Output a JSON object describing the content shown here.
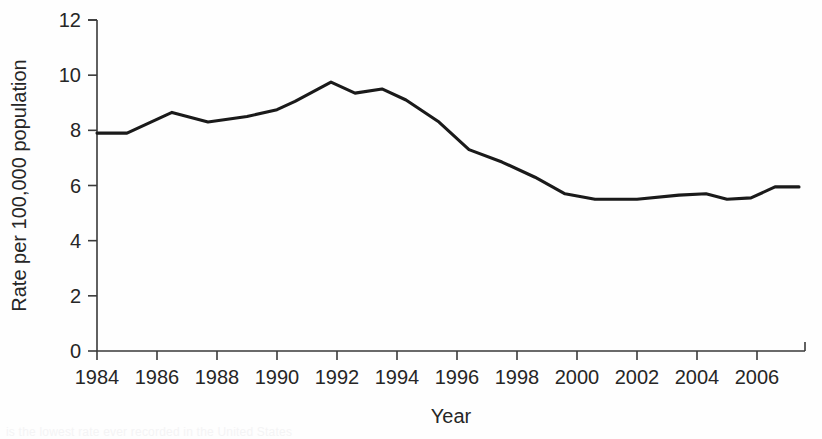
{
  "figure": {
    "background_color": "#fefefe",
    "line_color": "#1a1a1a",
    "axis_color": "#3a3a3a",
    "caption_partial": "is the lowest rate ever recorded in the United States"
  },
  "chart_data": {
    "type": "line",
    "title": "",
    "xlabel": "Year",
    "ylabel": "Rate per 100,000 population",
    "xlim": [
      1984,
      2007.6
    ],
    "ylim": [
      0,
      12
    ],
    "grid": false,
    "legend": null,
    "xticks": [
      1984,
      1986,
      1988,
      1990,
      1992,
      1994,
      1996,
      1998,
      2000,
      2002,
      2004,
      2006
    ],
    "xtick_labels": [
      "1984",
      "1986",
      "1988",
      "1990",
      "1992",
      "1994",
      "1996",
      "1998",
      "2000",
      "2002",
      "2004",
      "2006"
    ],
    "yticks": [
      0,
      2,
      4,
      6,
      8,
      10,
      12
    ],
    "ytick_labels": [
      "0",
      "2",
      "4",
      "6",
      "8",
      "10",
      "12"
    ],
    "series": [
      {
        "name": "Rate",
        "x": [
          1984,
          1985,
          1986.5,
          1987.7,
          1989,
          1990,
          1990.6,
          1991.8,
          1992.6,
          1993.5,
          1994.3,
          1995.4,
          1996.4,
          1997.5,
          1998.6,
          1999.6,
          2000.6,
          2002,
          2003.4,
          2004.3,
          2005,
          2005.8,
          2006.6,
          2007.4
        ],
        "y": [
          7.9,
          7.9,
          8.65,
          8.3,
          8.5,
          8.75,
          9.05,
          9.75,
          9.35,
          9.5,
          9.1,
          8.3,
          7.3,
          6.85,
          6.3,
          5.7,
          5.5,
          5.5,
          5.65,
          5.7,
          5.5,
          5.55,
          5.95,
          5.95
        ]
      }
    ]
  }
}
